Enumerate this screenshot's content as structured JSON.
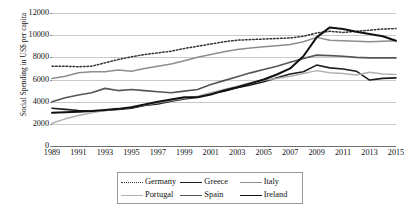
{
  "chart_data": {
    "type": "line",
    "title": "",
    "xlabel": "",
    "ylabel": "Social Spending in US$ per capita",
    "ylim": [
      0,
      12000
    ],
    "ytick_values": [
      0,
      2000,
      4000,
      6000,
      8000,
      10000,
      12000
    ],
    "ytick_labels": [
      "0",
      "2000",
      "4000",
      "6000",
      "8000",
      "10000",
      "12000"
    ],
    "xlim": [
      1989,
      2015
    ],
    "x": [
      1989,
      1990,
      1991,
      1992,
      1993,
      1994,
      1995,
      1996,
      1997,
      1998,
      1999,
      2000,
      2001,
      2002,
      2003,
      2004,
      2005,
      2006,
      2007,
      2008,
      2009,
      2010,
      2011,
      2012,
      2013,
      2014,
      2015
    ],
    "xtick_labels": [
      "1989",
      "1991",
      "1993",
      "1995",
      "1997",
      "1999",
      "2001",
      "2003",
      "2005",
      "2007",
      "2009",
      "2011",
      "2013",
      "2015"
    ],
    "grid": true,
    "legend_position": "below-center",
    "legend_columns": 3,
    "series": [
      {
        "name": "Germany",
        "style": "dotted",
        "color": "#333333",
        "width": 1.5,
        "values": [
          7200,
          7200,
          7150,
          7200,
          7500,
          7800,
          8050,
          8250,
          8400,
          8550,
          8800,
          9000,
          9200,
          9400,
          9550,
          9600,
          9650,
          9700,
          9750,
          9900,
          10200,
          10350,
          10250,
          10350,
          10450,
          10550,
          10600
        ]
      },
      {
        "name": "Greece",
        "style": "solid",
        "color": "#1c1c1c",
        "width": 1.6,
        "values": [
          3400,
          3300,
          3200,
          3150,
          3200,
          3300,
          3400,
          3650,
          3800,
          4050,
          4250,
          4400,
          4750,
          4950,
          5250,
          5500,
          5800,
          6150,
          6500,
          6700,
          7300,
          7050,
          6950,
          6750,
          5950,
          6100,
          6150
        ]
      },
      {
        "name": "Italy",
        "style": "solid",
        "color": "#8d8d8d",
        "width": 1.5,
        "values": [
          6100,
          6300,
          6600,
          6700,
          6700,
          6850,
          6750,
          7000,
          7200,
          7400,
          7700,
          8000,
          8250,
          8500,
          8700,
          8850,
          8950,
          9050,
          9150,
          9400,
          9800,
          9550,
          9500,
          9450,
          9400,
          9450,
          9500
        ]
      },
      {
        "name": "Portugal",
        "style": "solid",
        "color": "#b0b0b0",
        "width": 1.5,
        "values": [
          2050,
          2450,
          2750,
          3000,
          3200,
          3350,
          3500,
          3700,
          3900,
          4100,
          4300,
          4500,
          4800,
          5100,
          5400,
          5700,
          5950,
          6100,
          6300,
          6550,
          6800,
          6600,
          6550,
          6400,
          6650,
          6500,
          6450
        ]
      },
      {
        "name": "Spain",
        "style": "solid",
        "color": "#555555",
        "width": 1.6,
        "values": [
          4000,
          4350,
          4600,
          4800,
          5200,
          5000,
          5100,
          5000,
          4900,
          4800,
          4950,
          5100,
          5550,
          5900,
          6250,
          6600,
          6900,
          7200,
          7550,
          7900,
          8200,
          8150,
          8100,
          8000,
          7950,
          7950,
          7950
        ]
      },
      {
        "name": "Ireland",
        "style": "solid",
        "color": "#111111",
        "width": 2.0,
        "values": [
          3000,
          3050,
          3100,
          3150,
          3250,
          3350,
          3500,
          3750,
          4000,
          4200,
          4400,
          4400,
          4650,
          5000,
          5300,
          5650,
          6000,
          6450,
          7000,
          8100,
          9800,
          10700,
          10550,
          10300,
          10100,
          9900,
          9500
        ]
      }
    ]
  },
  "legend": {
    "entries": [
      {
        "label": "Germany",
        "style": "dotted",
        "color": "#333333"
      },
      {
        "label": "Greece",
        "style": "solid",
        "color": "#1c1c1c"
      },
      {
        "label": "Italy",
        "style": "solid",
        "color": "#8d8d8d"
      },
      {
        "label": "Portugal",
        "style": "solid",
        "color": "#b0b0b0"
      },
      {
        "label": "Spain",
        "style": "solid",
        "color": "#555555"
      },
      {
        "label": "Ireland",
        "style": "solid",
        "color": "#111111"
      }
    ]
  },
  "colors": {
    "gridline": "#c9c9c9",
    "axis": "#6e6e6e",
    "text": "#111111",
    "background": "#ffffff"
  }
}
